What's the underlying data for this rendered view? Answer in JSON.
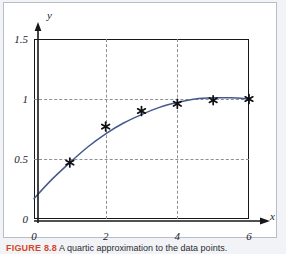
{
  "figure": {
    "caption_tag": "FIGURE 8.8",
    "caption_text": "A quartic approximation to the data points.",
    "caption_tag_color": "#d2472a",
    "frame_color": "#b9bdc7",
    "background": "#ffffff"
  },
  "chart_data": {
    "type": "scatter",
    "title": "",
    "subtitle": "",
    "xlabel": "x",
    "ylabel": "y",
    "xlim": [
      0,
      6
    ],
    "ylim": [
      0,
      1.5
    ],
    "grid": true,
    "grid_style": "dashed",
    "grid_color": "#8e8e93",
    "legend": "none",
    "x_ticks": [
      0,
      2,
      4,
      6
    ],
    "x_tick_labels": [
      "0",
      "2",
      "4",
      "6"
    ],
    "y_ticks": [
      0,
      0.5,
      1,
      1.5
    ],
    "y_tick_labels": [
      "0",
      "0.5",
      "1",
      "1.5"
    ],
    "grid_x": [
      2,
      4
    ],
    "grid_y": [
      0.5,
      1
    ],
    "axis_arrows": true,
    "series": [
      {
        "name": "data points",
        "type": "scatter",
        "marker": "star",
        "marker_color": "#101014",
        "x": [
          1,
          2,
          3,
          4,
          5,
          6
        ],
        "values": [
          0.47,
          0.77,
          0.9,
          0.96,
          0.99,
          1.0
        ]
      },
      {
        "name": "fitted curve",
        "type": "line",
        "color": "#44598c",
        "x": [
          0.0,
          0.5,
          1.0,
          1.5,
          2.0,
          2.5,
          3.0,
          3.5,
          4.0,
          4.5,
          5.0,
          5.5,
          6.0
        ],
        "values": [
          0.17,
          0.33,
          0.47,
          0.6,
          0.71,
          0.8,
          0.87,
          0.93,
          0.97,
          1.0,
          1.01,
          1.01,
          1.0
        ]
      }
    ]
  },
  "axes": {
    "y_axis_label": "y",
    "x_axis_label": "x"
  }
}
